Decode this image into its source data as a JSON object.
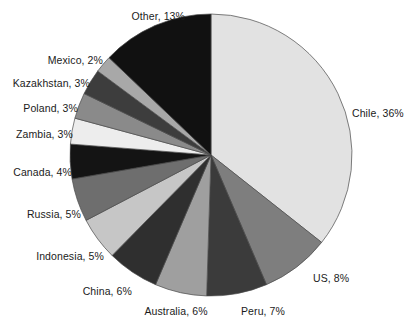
{
  "chart_data": {
    "type": "pie",
    "title": "",
    "subtitle": "",
    "xlabel": "",
    "ylabel": "",
    "legend_position": "none",
    "labels_outside": true,
    "start_angle_deg": 0,
    "direction": "clockwise",
    "categories": [
      "Chile",
      "US",
      "Peru",
      "Australia",
      "China",
      "Indonesia",
      "Russia",
      "Canada",
      "Zambia",
      "Poland",
      "Kazakhstan",
      "Mexico",
      "Other"
    ],
    "values": [
      36,
      8,
      7,
      6,
      6,
      5,
      5,
      4,
      3,
      3,
      3,
      2,
      13
    ],
    "value_suffix": "%",
    "total": 101,
    "slices": [
      {
        "name": "Chile",
        "value": 36,
        "label": "Chile, 36%",
        "color": "#e2e2e2",
        "label_x": 352,
        "label_y": 113,
        "anchor": "start"
      },
      {
        "name": "US",
        "value": 8,
        "label": "US, 8%",
        "color": "#7e7e7e",
        "label_x": 313,
        "label_y": 278,
        "anchor": "start"
      },
      {
        "name": "Peru",
        "value": 7,
        "label": "Peru, 7%",
        "color": "#3b3b3b",
        "label_x": 263,
        "label_y": 311,
        "anchor": "middle"
      },
      {
        "name": "Australia",
        "value": 6,
        "label": "Australia, 6%",
        "color": "#9f9f9f",
        "label_x": 176,
        "label_y": 311,
        "anchor": "middle"
      },
      {
        "name": "China",
        "value": 6,
        "label": "China, 6%",
        "color": "#2f2f2f",
        "label_x": 132,
        "label_y": 291,
        "anchor": "end"
      },
      {
        "name": "Indonesia",
        "value": 5,
        "label": "Indonesia, 5%",
        "color": "#c6c6c6",
        "label_x": 104,
        "label_y": 256,
        "anchor": "end"
      },
      {
        "name": "Russia",
        "value": 5,
        "label": "Russia, 5%",
        "color": "#6e6e6e",
        "label_x": 81,
        "label_y": 214,
        "anchor": "end"
      },
      {
        "name": "Canada",
        "value": 4,
        "label": "Canada, 4%",
        "color": "#141414",
        "label_x": 72,
        "label_y": 172,
        "anchor": "end"
      },
      {
        "name": "Zambia",
        "value": 3,
        "label": "Zambia, 3%",
        "color": "#ededed",
        "label_x": 73,
        "label_y": 134,
        "anchor": "end"
      },
      {
        "name": "Poland",
        "value": 3,
        "label": "Poland, 3%",
        "color": "#8a8a8a",
        "label_x": 78,
        "label_y": 108,
        "anchor": "end"
      },
      {
        "name": "Kazakhstan",
        "value": 3,
        "label": "Kazakhstan, 3%",
        "color": "#3d3d3d",
        "label_x": 90,
        "label_y": 83,
        "anchor": "end"
      },
      {
        "name": "Mexico",
        "value": 2,
        "label": "Mexico, 2%",
        "color": "#a8a8a8",
        "label_x": 103,
        "label_y": 60,
        "anchor": "end"
      },
      {
        "name": "Other",
        "value": 13,
        "label": "Other, 13%",
        "color": "#111111",
        "label_x": 185,
        "label_y": 16,
        "anchor": "end"
      }
    ],
    "geometry": {
      "cx": 211,
      "cy": 155,
      "r": 141
    },
    "stroke_color": "#4a4a4a",
    "background_color": "#ffffff"
  }
}
